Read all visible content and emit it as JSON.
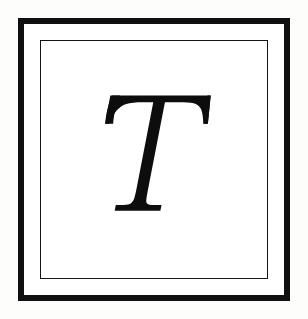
{
  "canvas": {
    "width": 308,
    "height": 319,
    "background_color": "#fdfdfc"
  },
  "plate": {
    "name": "framed-initial-plate",
    "x": 18,
    "y": 18,
    "width": 272,
    "height": 283,
    "field_color": "#ffffff",
    "outer_border": {
      "color": "#101010",
      "thickness_px": 6
    },
    "gap": {
      "color": "#ffffff",
      "thickness_px": 4
    },
    "inner_border": {
      "color": "#141414",
      "thickness_px": 1
    }
  },
  "glyph": {
    "name": "decorative-initial-T",
    "character": "T",
    "case": "uppercase",
    "style": "italic",
    "typeface_class": "transitional-serif",
    "fill_color": "#0d0d0d",
    "bounds": {
      "left": 95,
      "right": 225,
      "top": 80,
      "bottom": 222
    },
    "features": {
      "top_bar": "flared horizontal bar with downward hooked bracket serifs at both ends",
      "stem": "italic stem slanting right-to-left from top bar down to foot",
      "foot_serif": "flat horizontal slab serif with concave flared joins"
    }
  }
}
